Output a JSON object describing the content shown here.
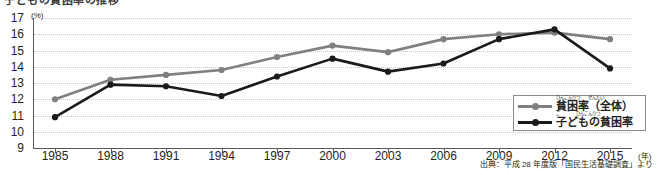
{
  "title_partial": "子どもの貧困率の推移",
  "axis": {
    "y_unit": "(%)",
    "x_unit": "(年)",
    "y_ticks": [
      "17",
      "16",
      "15",
      "14",
      "13",
      "12",
      "11",
      "10",
      "9"
    ],
    "x_ticks": [
      "1985",
      "1988",
      "1991",
      "1994",
      "1997",
      "2000",
      "2003",
      "2006",
      "2009",
      "2012",
      "2015"
    ]
  },
  "legend": {
    "items": [
      {
        "label": "貧困率（全体）",
        "ruby": "ひんこんりつ　　ぜんたい",
        "color": "#808080"
      },
      {
        "label": "子どもの貧困率",
        "ruby": "こ　　　　ひんこんりつ",
        "color": "#1a1a1a"
      }
    ]
  },
  "source": "出典：平成 28 年度版「国民生活基礎調査」より",
  "chart_data": {
    "type": "line",
    "title": "子どもの貧困率の推移",
    "xlabel": "(年)",
    "ylabel": "(%)",
    "ylim": [
      9,
      17
    ],
    "grid": true,
    "legend_position": "bottom-right",
    "categories": [
      "1985",
      "1988",
      "1991",
      "1994",
      "1997",
      "2000",
      "2003",
      "2006",
      "2009",
      "2012",
      "2015"
    ],
    "series": [
      {
        "name": "貧困率（全体）",
        "color": "#808080",
        "values": [
          12.0,
          13.2,
          13.5,
          13.8,
          14.6,
          15.3,
          14.9,
          15.7,
          16.0,
          16.1,
          15.7
        ]
      },
      {
        "name": "子どもの貧困率",
        "color": "#1a1a1a",
        "values": [
          10.9,
          12.9,
          12.8,
          12.2,
          13.4,
          14.5,
          13.7,
          14.2,
          15.7,
          16.3,
          13.9
        ]
      }
    ],
    "annotations": [
      "出典：平成 28 年度版「国民生活基礎調査」より"
    ]
  }
}
